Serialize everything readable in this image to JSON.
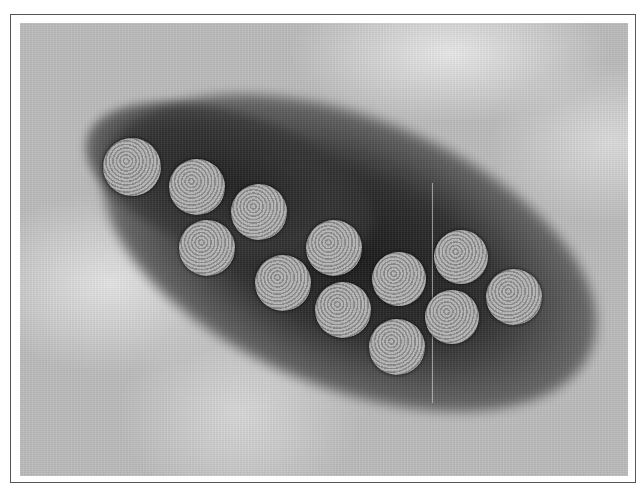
{
  "image": {
    "description": "Negative-stain electron micrograph of icosahedral virus particles",
    "particle_count": 14,
    "colors": {
      "frame_border": "#555555",
      "background_stain": "#bdbdbd",
      "dark_stain": "#1a1a1a",
      "particle": "#a8a8a8"
    },
    "particles": [
      {
        "cx": 132,
        "cy": 167,
        "r": 29
      },
      {
        "cx": 197,
        "cy": 187,
        "r": 28
      },
      {
        "cx": 259,
        "cy": 212,
        "r": 28
      },
      {
        "cx": 207,
        "cy": 248,
        "r": 28
      },
      {
        "cx": 334,
        "cy": 248,
        "r": 28
      },
      {
        "cx": 283,
        "cy": 283,
        "r": 28
      },
      {
        "cx": 399,
        "cy": 279,
        "r": 27
      },
      {
        "cx": 461,
        "cy": 257,
        "r": 27
      },
      {
        "cx": 343,
        "cy": 310,
        "r": 28
      },
      {
        "cx": 514,
        "cy": 297,
        "r": 28
      },
      {
        "cx": 452,
        "cy": 317,
        "r": 27
      },
      {
        "cx": 397,
        "cy": 347,
        "r": 28
      }
    ]
  }
}
